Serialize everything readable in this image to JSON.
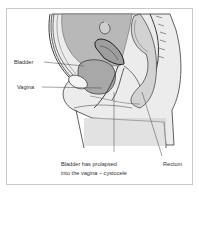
{
  "diagram": {
    "type": "anatomical-illustration",
    "labels": {
      "bladder": "Bladder",
      "vagina": "Vagina",
      "rectum": "Rectum",
      "caption_line1": "Bladder has prolapsed",
      "caption_line2": "into the vagina – cystocele"
    },
    "colors": {
      "border": "#c8c8c8",
      "tissue_light": "#e6e6e6",
      "tissue_mid": "#bdbdbd",
      "tissue_dark": "#8c8c8c",
      "outline": "#3a3a3a",
      "text": "#333333"
    }
  }
}
